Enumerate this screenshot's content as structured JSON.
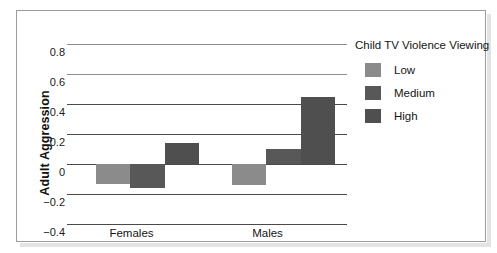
{
  "chart_data": {
    "type": "bar",
    "title": "",
    "xlabel": "",
    "ylabel": "Adult Aggression",
    "ylim": [
      -0.4,
      0.8
    ],
    "yticks": [
      "0.8",
      "0.6",
      "0.4",
      "0.2",
      "0",
      "−0.2",
      "−0.4"
    ],
    "ytick_values": [
      0.8,
      0.6,
      0.4,
      0.2,
      0,
      -0.2,
      -0.4
    ],
    "grid": true,
    "legend_position": "right",
    "categories": [
      "Females",
      "Males"
    ],
    "series": [
      {
        "name": "Low",
        "color": "#8b8b8b",
        "values": [
          -0.13,
          -0.14
        ]
      },
      {
        "name": "Medium",
        "color": "#585858",
        "values": [
          -0.16,
          0.1
        ]
      },
      {
        "name": "High",
        "color": "#4f4f4f",
        "values": [
          0.14,
          0.45
        ]
      }
    ]
  },
  "legend": {
    "title": "Child TV Violence Viewing",
    "items": [
      {
        "label": "Low",
        "color": "#8b8b8b"
      },
      {
        "label": "Medium",
        "color": "#585858"
      },
      {
        "label": "High",
        "color": "#4f4f4f"
      }
    ]
  },
  "axes": {
    "y_title": "Adult Aggression"
  },
  "colors": {
    "frame": "#9a9ca0",
    "gridline": "#4a4a4a",
    "text": "#151515",
    "low": "#8b8b8b",
    "medium": "#585858",
    "high": "#4f4f4f"
  }
}
